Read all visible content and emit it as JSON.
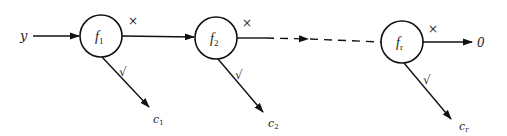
{
  "diagram": {
    "input_label": "y",
    "output_label": "0",
    "reject_mark": "×",
    "accept_mark": "√",
    "nodes": [
      {
        "name": "f",
        "sub": "1",
        "output": "c",
        "output_sub": "1"
      },
      {
        "name": "f",
        "sub": "2",
        "output": "c",
        "output_sub": "2"
      },
      {
        "name": "f",
        "sub": "r",
        "output": "c",
        "output_sub": "r"
      }
    ],
    "colors": {
      "stroke": "#111111",
      "background": "#ffffff"
    }
  }
}
